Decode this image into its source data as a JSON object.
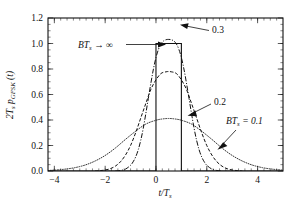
{
  "figure": {
    "background_color": "#ffffff",
    "line_color": "#111111"
  },
  "chart_data": {
    "type": "line",
    "title": "",
    "subtitle": "",
    "xlabel": "t/Ts",
    "xlabel_parts": {
      "main": "t/T",
      "sub": "s"
    },
    "ylabel": "2Ts pGFSK (t)",
    "ylabel_parts": {
      "lead": "2T",
      "lead_sub": "s",
      "mid": " p",
      "mid_sub": "GFSK",
      "tail": " (t)"
    },
    "xlim": [
      -4.25,
      5.0
    ],
    "ylim": [
      0.0,
      1.2
    ],
    "grid": false,
    "legend_position": "none",
    "xticks": [
      -4,
      -2,
      0,
      2,
      4
    ],
    "xticklabels": [
      "−4",
      "−2",
      "0",
      "2",
      "4"
    ],
    "xtick_minor_step": 0.25,
    "yticks": [
      0.0,
      0.2,
      0.4,
      0.6,
      0.8,
      1.0,
      1.2
    ],
    "yticklabels": [
      "0.0",
      "0.2",
      "0.4",
      "0.6",
      "0.8",
      "1.0",
      "1.2"
    ],
    "ytick_minor_step": 0.05,
    "series": [
      {
        "name": "BTs -> infinity",
        "label": "BTs → ∞",
        "style": "solid",
        "description": "rectangular pulse of unit height spanning t/Ts = 0 to 1",
        "x": [
          -4.25,
          0,
          0,
          1,
          1,
          5.0
        ],
        "values": [
          0,
          0,
          1.0,
          1.0,
          0,
          0
        ]
      },
      {
        "name": "BTs = 0.3",
        "label": "0.3",
        "style": "dashdot",
        "peak_value": 1.03,
        "peak_x": 0.5,
        "x": [
          -1.6,
          -1.4,
          -1.2,
          -1.0,
          -0.9,
          -0.8,
          -0.7,
          -0.6,
          -0.5,
          -0.4,
          -0.3,
          -0.2,
          -0.1,
          0.0,
          0.1,
          0.2,
          0.3,
          0.4,
          0.5,
          0.6,
          0.7,
          0.8,
          0.9,
          1.0,
          1.1,
          1.2,
          1.3,
          1.4,
          1.5,
          1.6,
          1.7,
          1.8,
          1.9,
          2.0,
          2.2,
          2.4,
          2.6
        ],
        "values": [
          0.0,
          0.004,
          0.015,
          0.045,
          0.072,
          0.11,
          0.165,
          0.24,
          0.335,
          0.45,
          0.57,
          0.69,
          0.8,
          0.89,
          0.955,
          0.998,
          1.02,
          1.03,
          1.032,
          1.03,
          1.02,
          0.998,
          0.955,
          0.89,
          0.8,
          0.69,
          0.57,
          0.45,
          0.335,
          0.24,
          0.165,
          0.11,
          0.072,
          0.045,
          0.015,
          0.004,
          0.0
        ]
      },
      {
        "name": "BTs = 0.2",
        "label": "0.2",
        "style": "dashed",
        "peak_value": 0.78,
        "peak_x": 0.5,
        "x": [
          -2.4,
          -2.2,
          -2.0,
          -1.8,
          -1.6,
          -1.4,
          -1.2,
          -1.0,
          -0.8,
          -0.6,
          -0.4,
          -0.2,
          0.0,
          0.2,
          0.4,
          0.5,
          0.6,
          0.8,
          1.0,
          1.2,
          1.4,
          1.6,
          1.8,
          2.0,
          2.2,
          2.4,
          2.6,
          2.8,
          3.0,
          3.2,
          3.4
        ],
        "values": [
          0.0,
          0.003,
          0.008,
          0.018,
          0.038,
          0.072,
          0.125,
          0.2,
          0.3,
          0.415,
          0.53,
          0.64,
          0.715,
          0.765,
          0.778,
          0.78,
          0.778,
          0.765,
          0.715,
          0.64,
          0.53,
          0.415,
          0.3,
          0.2,
          0.125,
          0.072,
          0.038,
          0.018,
          0.008,
          0.003,
          0.0
        ]
      },
      {
        "name": "BTs = 0.1",
        "label": "BTs = 0.1",
        "style": "dotted",
        "peak_value": 0.41,
        "peak_x": 0.5,
        "x": [
          -4.25,
          -4.0,
          -3.6,
          -3.2,
          -2.8,
          -2.4,
          -2.0,
          -1.6,
          -1.2,
          -0.8,
          -0.4,
          0.0,
          0.25,
          0.5,
          0.75,
          1.0,
          1.4,
          1.8,
          2.2,
          2.6,
          3.0,
          3.4,
          3.8,
          4.2,
          4.6,
          5.0
        ],
        "values": [
          0.004,
          0.007,
          0.014,
          0.026,
          0.046,
          0.078,
          0.122,
          0.18,
          0.248,
          0.312,
          0.368,
          0.398,
          0.408,
          0.412,
          0.408,
          0.398,
          0.368,
          0.312,
          0.248,
          0.18,
          0.122,
          0.078,
          0.046,
          0.026,
          0.014,
          0.007
        ]
      }
    ],
    "annotations": [
      {
        "id": "annot-bts-inf",
        "text": "BTs → ∞",
        "parts": {
          "lead": "BT",
          "lead_sub": "s",
          "tail": " → ∞"
        },
        "points_to": "rectangular pulse left edge"
      },
      {
        "id": "annot-03",
        "text": "0.3",
        "points_to": "dash-dot curve peak"
      },
      {
        "id": "annot-02",
        "text": "0.2",
        "points_to": "dashed curve right tail"
      },
      {
        "id": "annot-bts-01",
        "text": "BTs = 0.1",
        "parts": {
          "lead": "BT",
          "lead_sub": "s",
          "tail": " = 0.1"
        },
        "points_to": "dotted curve right tail"
      }
    ]
  }
}
